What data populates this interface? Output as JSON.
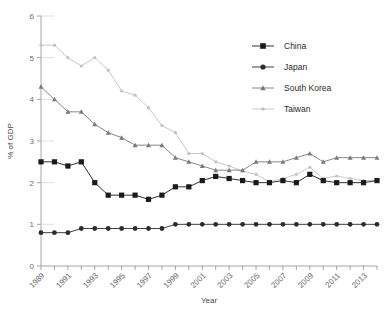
{
  "chart_data": {
    "type": "line",
    "title": "",
    "xlabel": "Year",
    "ylabel": "% of GDP",
    "ylim": [
      0,
      6
    ],
    "yticks": [
      0,
      1,
      2,
      3,
      4,
      5,
      6
    ],
    "xlim": [
      1989,
      2014
    ],
    "grid": false,
    "legend_position": "top-right",
    "x": [
      1989,
      1990,
      1991,
      1992,
      1993,
      1994,
      1995,
      1996,
      1997,
      1998,
      1999,
      2000,
      2001,
      2002,
      2003,
      2004,
      2005,
      2006,
      2007,
      2008,
      2009,
      2010,
      2011,
      2012,
      2013,
      2014
    ],
    "xtick_labels": [
      "1989",
      "1991",
      "1993",
      "1995",
      "1997",
      "1999",
      "2001",
      "2003",
      "2005",
      "2007",
      "2009",
      "2011",
      "2013"
    ],
    "xtick_values": [
      1989,
      1991,
      1993,
      1995,
      1997,
      1999,
      2001,
      2003,
      2005,
      2007,
      2009,
      2011,
      2013
    ],
    "series": [
      {
        "name": "China",
        "marker": "square",
        "color": "#1a1a1a",
        "values": [
          2.5,
          2.5,
          2.4,
          2.5,
          2.0,
          1.7,
          1.7,
          1.7,
          1.6,
          1.7,
          1.9,
          1.9,
          2.05,
          2.15,
          2.1,
          2.05,
          2.0,
          2.0,
          2.05,
          2.0,
          2.2,
          2.05,
          2.0,
          2.0,
          2.0,
          2.05
        ]
      },
      {
        "name": "Japan",
        "marker": "circle",
        "color": "#2b2b2b",
        "values": [
          0.8,
          0.8,
          0.8,
          0.9,
          0.9,
          0.9,
          0.9,
          0.9,
          0.9,
          0.9,
          1.0,
          1.0,
          1.0,
          1.0,
          1.0,
          1.0,
          1.0,
          1.0,
          1.0,
          1.0,
          1.0,
          1.0,
          1.0,
          1.0,
          1.0,
          1.0
        ]
      },
      {
        "name": "South Korea",
        "marker": "triangle",
        "color": "#7a7a7a",
        "values": [
          4.3,
          4.0,
          3.7,
          3.7,
          3.4,
          3.2,
          3.08,
          2.9,
          2.9,
          2.9,
          2.6,
          2.5,
          2.4,
          2.3,
          2.3,
          2.3,
          2.5,
          2.5,
          2.5,
          2.6,
          2.7,
          2.5,
          2.6,
          2.6,
          2.6,
          2.6
        ]
      },
      {
        "name": "Taiwan",
        "marker": "diamond",
        "color": "#c2c2c2",
        "values": [
          5.3,
          5.3,
          5.0,
          4.8,
          5.0,
          4.7,
          4.2,
          4.1,
          3.8,
          3.37,
          3.2,
          2.7,
          2.7,
          2.5,
          2.4,
          2.28,
          2.2,
          2.02,
          2.1,
          2.2,
          2.37,
          2.1,
          2.16,
          2.1,
          2.05,
          2.05
        ]
      }
    ]
  },
  "legend": {
    "items": [
      {
        "label": "China"
      },
      {
        "label": "Japan"
      },
      {
        "label": "South Korea"
      },
      {
        "label": "Taiwan"
      }
    ]
  },
  "axes": {
    "y_title": "% of GDP",
    "x_title": "Year"
  }
}
